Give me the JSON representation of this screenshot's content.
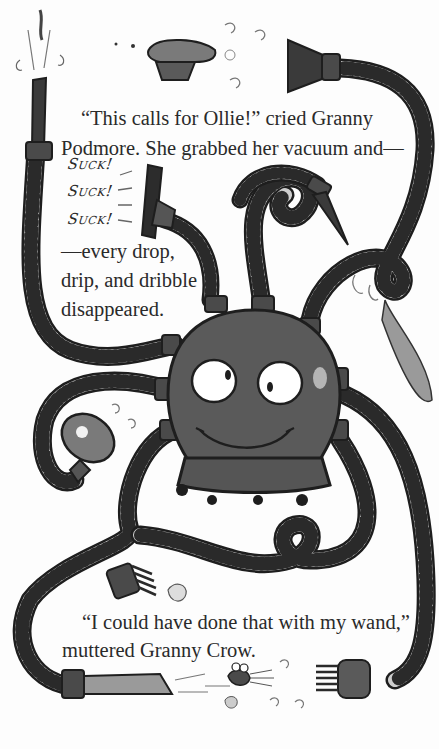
{
  "story": {
    "paragraph1": {
      "line1": "“This calls for Ollie!” cried Granny",
      "line2": "Podmore. She grabbed her vacuum and—"
    },
    "sound_effects": [
      "Suck!",
      "Suck!",
      "Suck!"
    ],
    "paragraph2": {
      "line1": "—every drop,",
      "line2": "drip, and dribble",
      "line3": "disappeared."
    },
    "paragraph3": {
      "line1": "“I could have done that with my wand,”",
      "line2": "muttered Granny Crow."
    }
  },
  "illustration": {
    "character": "Ollie the vacuum robot",
    "elements": [
      "muffin",
      "vacuum-nozzle",
      "showerhead",
      "brush-attachment",
      "crevice-tool",
      "bug",
      "hoses"
    ],
    "colors": {
      "body": "#5a5a5a",
      "hose": "#c8c8c8",
      "outline": "#1e1e1e",
      "attachment": "#3a3a3a"
    }
  }
}
